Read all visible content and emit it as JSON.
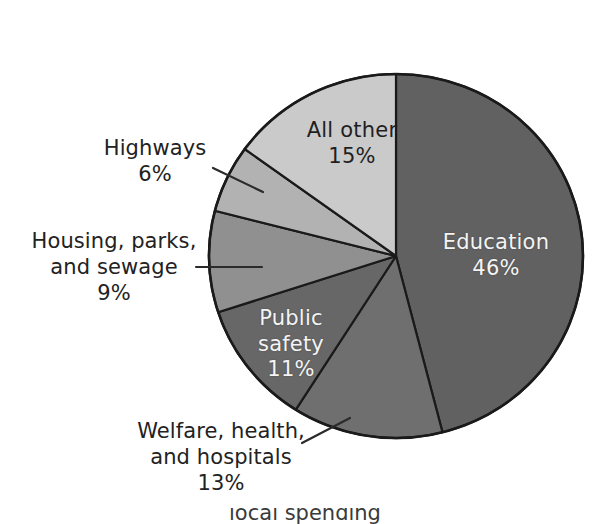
{
  "figure": {
    "background_color": "#ffffff",
    "outline_color": "#1a1a1a",
    "bottom_caption_partial": "local spending"
  },
  "chart_data": {
    "type": "pie",
    "title": "",
    "subtitle": "",
    "xlabel": "",
    "ylabel": "",
    "legend_position": "none",
    "grid": false,
    "start_angle_deg": 0,
    "direction": "clockwise",
    "units": "percent",
    "total": 100,
    "categories": [
      "Education",
      "Welfare, health, and hospitals",
      "Public safety",
      "Housing, parks, and sewage",
      "Highways",
      "All other"
    ],
    "values": [
      46,
      13,
      11,
      9,
      6,
      15
    ],
    "slices": [
      {
        "name": "Education",
        "label_line1": "Education",
        "label_line2": "",
        "percent_text": "46%",
        "value": 46,
        "color": "#616161",
        "text_color": "#f4f4f4",
        "label_placement": "inside"
      },
      {
        "name": "Welfare, health, and hospitals",
        "label_line1": "Welfare, health,",
        "label_line2": "and hospitals",
        "percent_text": "13%",
        "value": 13,
        "color": "#6f6f6f",
        "text_color": "#222222",
        "label_placement": "outside"
      },
      {
        "name": "Public safety",
        "label_line1": "Public",
        "label_line2": "safety",
        "percent_text": "11%",
        "value": 11,
        "color": "#676767",
        "text_color": "#f4f4f4",
        "label_placement": "inside"
      },
      {
        "name": "Housing, parks, and sewage",
        "label_line1": "Housing, parks,",
        "label_line2": "and sewage",
        "percent_text": "9%",
        "value": 9,
        "color": "#909090",
        "text_color": "#222222",
        "label_placement": "outside"
      },
      {
        "name": "Highways",
        "label_line1": "Highways",
        "label_line2": "",
        "percent_text": "6%",
        "value": 6,
        "color": "#b2b2b2",
        "text_color": "#222222",
        "label_placement": "outside"
      },
      {
        "name": "All other",
        "label_line1": "All other",
        "label_line2": "",
        "percent_text": "15%",
        "value": 15,
        "color": "#cacaca",
        "text_color": "#1f1f1f",
        "label_placement": "inside"
      }
    ]
  }
}
